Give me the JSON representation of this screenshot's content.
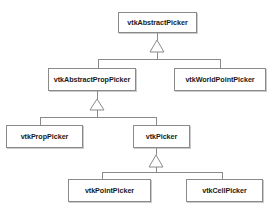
{
  "diagram": {
    "type": "uml-class-diagram",
    "relationship": "generalization",
    "canvas": {
      "width": 271,
      "height": 212
    },
    "style": {
      "background": "#ffffff",
      "box_fill": "#ffffff",
      "box_border": "#8a8a8a",
      "line_color": "#8a8a8a",
      "text_color": "#1a1a1a",
      "arrow_fill": "#ffffff"
    },
    "classes": [
      {
        "id": "vtkAbstractPicker",
        "label": "vtkAbstractPicker",
        "x": 118,
        "y": 12,
        "w": 79,
        "h": 21,
        "level": 0
      },
      {
        "id": "vtkAbstractPropPicker",
        "label": "vtkAbstractPropPicker",
        "x": 48,
        "y": 68,
        "w": 88,
        "h": 23,
        "level": 1
      },
      {
        "id": "vtkWorldPointPicker",
        "label": "vtkWorldPointPicker",
        "x": 174,
        "y": 68,
        "w": 92,
        "h": 23,
        "level": 1
      },
      {
        "id": "vtkPropPicker",
        "label": "vtkPropPicker",
        "x": 6,
        "y": 125,
        "w": 77,
        "h": 23,
        "level": 2
      },
      {
        "id": "vtkPicker",
        "label": "vtkPicker",
        "x": 133,
        "y": 125,
        "w": 57,
        "h": 23,
        "level": 2
      },
      {
        "id": "vtkPointPicker",
        "label": "vtkPointPicker",
        "x": 68,
        "y": 179,
        "w": 83,
        "h": 23,
        "level": 3
      },
      {
        "id": "vtkCellPicker",
        "label": "vtkCellPicker",
        "x": 186,
        "y": 179,
        "w": 77,
        "h": 23,
        "level": 3
      }
    ],
    "generalizations": [
      {
        "id": "gen-abstractpicker",
        "parent": "vtkAbstractPicker",
        "children": [
          "vtkAbstractPropPicker",
          "vtkWorldPointPicker"
        ],
        "arrow": {
          "cx": 157,
          "tip_y": 40,
          "base_y": 52,
          "half_w": 7
        },
        "stem": {
          "x": 157,
          "y1": 33,
          "y2": 40
        },
        "drop": {
          "x": 157,
          "y1": 52,
          "y2": 59
        },
        "bus": {
          "y": 59,
          "x1": 98,
          "x2": 220
        },
        "legs": [
          {
            "x": 98,
            "y1": 59,
            "y2": 68
          },
          {
            "x": 220,
            "y1": 59,
            "y2": 68
          }
        ]
      },
      {
        "id": "gen-abstractproppicker",
        "parent": "vtkAbstractPropPicker",
        "children": [
          "vtkPropPicker",
          "vtkPicker"
        ],
        "arrow": {
          "cx": 97,
          "tip_y": 99,
          "base_y": 110,
          "half_w": 7
        },
        "stem": {
          "x": 97,
          "y1": 91,
          "y2": 99
        },
        "drop": {
          "x": 97,
          "y1": 110,
          "y2": 117
        },
        "bus": {
          "y": 117,
          "x1": 40,
          "x2": 156
        },
        "legs": [
          {
            "x": 40,
            "y1": 117,
            "y2": 125
          },
          {
            "x": 156,
            "y1": 117,
            "y2": 125
          }
        ]
      },
      {
        "id": "gen-picker",
        "parent": "vtkPicker",
        "children": [
          "vtkPointPicker",
          "vtkCellPicker"
        ],
        "arrow": {
          "cx": 156,
          "tip_y": 155,
          "base_y": 167,
          "half_w": 7
        },
        "stem": {
          "x": 156,
          "y1": 148,
          "y2": 155
        },
        "drop": {
          "x": 156,
          "y1": 167,
          "y2": 172
        },
        "bus": {
          "y": 172,
          "x1": 102,
          "x2": 222
        },
        "legs": [
          {
            "x": 102,
            "y1": 172,
            "y2": 179
          },
          {
            "x": 222,
            "y1": 172,
            "y2": 179
          }
        ]
      }
    ]
  }
}
